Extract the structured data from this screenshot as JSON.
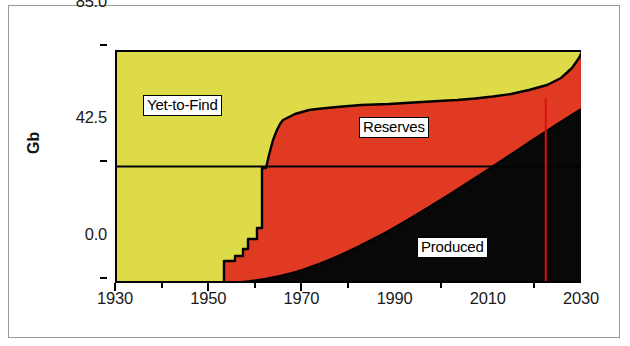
{
  "figure": {
    "y_axis_title": "Gb",
    "colors": {
      "yet_to_find": "#DDDC48",
      "reserves": "#E03A22",
      "produced": "#080808",
      "outline": "#000000",
      "marker_line": "#D81010",
      "frame": "#9A9A9A"
    }
  },
  "labels": {
    "yet_to_find": "Yet-to-Find",
    "reserves": "Reserves",
    "produced": "Produced"
  },
  "chart_data": {
    "type": "area",
    "title": "",
    "xlabel": "",
    "ylabel": "Gb",
    "xlim": [
      1930,
      2030
    ],
    "ylim": [
      0.0,
      85.0
    ],
    "ytick_labels": [
      "0.0",
      "42.5",
      "85.0"
    ],
    "yticks": [
      0.0,
      42.5,
      85.0
    ],
    "xtick_labels": [
      "1930",
      "1950",
      "1970",
      "1990",
      "2010",
      "2030"
    ],
    "xticks_major": [
      1930,
      1950,
      1970,
      1990,
      2010,
      2030
    ],
    "xticks_minor": [
      1940,
      1960,
      1980,
      2000,
      2020
    ],
    "grid": "horizontal-line-at-42.5",
    "stacked": true,
    "stack_total": 85.0,
    "legend": "inline-boxed-labels",
    "annotations": [
      {
        "name": "present-day-marker",
        "type": "vline",
        "x": 2022,
        "color": "#D81010"
      }
    ],
    "x": [
      1930,
      1940,
      1950,
      1953,
      1955,
      1957,
      1959,
      1961,
      1962,
      1964,
      1966,
      1968,
      1970,
      1972,
      1974,
      1976,
      1978,
      1980,
      1985,
      1990,
      1995,
      2000,
      2005,
      2010,
      2015,
      2020,
      2025,
      2030
    ],
    "series": [
      {
        "name": "Produced",
        "values": [
          0.0,
          0.0,
          0.0,
          0.2,
          0.4,
          0.7,
          1.0,
          1.4,
          1.7,
          2.3,
          3.0,
          3.9,
          5.0,
          6.3,
          7.6,
          8.9,
          10.3,
          11.8,
          15.4,
          19.2,
          23.2,
          27.4,
          31.8,
          36.3,
          41.0,
          45.8,
          50.8,
          56.0
        ]
      },
      {
        "name": "Reserves",
        "values": [
          0.0,
          0.0,
          0.0,
          8.0,
          8.2,
          12.0,
          12.5,
          22.0,
          26.0,
          38.0,
          46.0,
          53.0,
          57.0,
          59.0,
          60.5,
          61.5,
          62.0,
          62.8,
          63.0,
          63.2,
          63.5,
          64.0,
          65.5,
          67.5,
          70.0,
          73.5,
          78.5,
          85.0
        ]
      },
      {
        "name": "Yet-to-Find",
        "values": [
          85.0,
          85.0,
          85.0,
          85.0,
          85.0,
          85.0,
          85.0,
          85.0,
          85.0,
          85.0,
          85.0,
          85.0,
          85.0,
          85.0,
          85.0,
          85.0,
          85.0,
          85.0,
          85.0,
          85.0,
          85.0,
          85.0,
          85.0,
          85.0,
          85.0,
          85.0,
          85.0,
          85.0
        ]
      }
    ]
  }
}
